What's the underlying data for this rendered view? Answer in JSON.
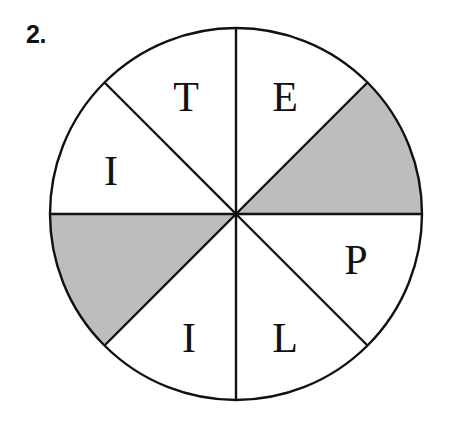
{
  "figure": {
    "problem_number": "2.",
    "colors": {
      "background": "#ffffff",
      "outline": "#111111",
      "shaded_sector_fill": "#bdbdbd",
      "unshaded_sector_fill": "#ffffff",
      "label_text": "#111111"
    },
    "geometry": {
      "center_x": 236,
      "center_y": 214,
      "radius": 186,
      "sector_count": 8,
      "sector_angle_degrees": 45,
      "stroke_width": 2.4
    },
    "sectors": [
      {
        "id": "sector-1",
        "position": "upper-right-outer",
        "start_angle_deg": 0,
        "end_angle_deg": 45,
        "shaded": true,
        "label": ""
      },
      {
        "id": "sector-2",
        "position": "upper-right-inner",
        "start_angle_deg": 45,
        "end_angle_deg": 90,
        "shaded": false,
        "label": "E"
      },
      {
        "id": "sector-3",
        "position": "upper-left-inner",
        "start_angle_deg": 90,
        "end_angle_deg": 135,
        "shaded": false,
        "label": "T"
      },
      {
        "id": "sector-4",
        "position": "upper-left-outer",
        "start_angle_deg": 135,
        "end_angle_deg": 180,
        "shaded": false,
        "label": "I"
      },
      {
        "id": "sector-5",
        "position": "lower-left-outer",
        "start_angle_deg": 180,
        "end_angle_deg": 225,
        "shaded": true,
        "label": ""
      },
      {
        "id": "sector-6",
        "position": "lower-left-inner",
        "start_angle_deg": 225,
        "end_angle_deg": 270,
        "shaded": false,
        "label": "I"
      },
      {
        "id": "sector-7",
        "position": "lower-right-inner",
        "start_angle_deg": 270,
        "end_angle_deg": 315,
        "shaded": false,
        "label": "L"
      },
      {
        "id": "sector-8",
        "position": "lower-right-outer",
        "start_angle_deg": 315,
        "end_angle_deg": 360,
        "shaded": false,
        "label": "P"
      }
    ],
    "labels": [
      {
        "text": "T",
        "x": 186,
        "y": 97
      },
      {
        "text": "E",
        "x": 285,
        "y": 97
      },
      {
        "text": "I",
        "x": 111,
        "y": 171
      },
      {
        "text": "P",
        "x": 356,
        "y": 260
      },
      {
        "text": "I",
        "x": 189,
        "y": 338
      },
      {
        "text": "L",
        "x": 285,
        "y": 338
      }
    ]
  }
}
